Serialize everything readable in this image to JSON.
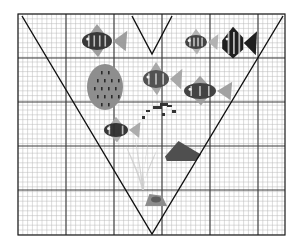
{
  "scene": {
    "title": "Aquarium scene on graph paper with V annotation",
    "canvas": {
      "width": 295,
      "height": 247,
      "background": "#ffffff"
    },
    "plot_area": {
      "x": 18,
      "y": 14,
      "width": 267,
      "height": 221
    },
    "border": {
      "color": "#1a1a1a",
      "width": 1.2
    }
  },
  "grid": {
    "minor": {
      "spacing": 4.8,
      "color": "#b9b9b9",
      "width": 0.5
    },
    "major": {
      "spacing": 48,
      "color": "#3a3a3a",
      "width": 1.1
    },
    "major_x": [
      66,
      114,
      162,
      210,
      258
    ],
    "major_y": [
      58,
      102,
      146,
      190
    ]
  },
  "annotations": {
    "big_v": {
      "name": "large-v-stroke",
      "color": "#111111",
      "width": 1.4,
      "points": "22,16 152,234 283,16"
    },
    "small_v": {
      "name": "small-v-stroke",
      "color": "#111111",
      "width": 1.4,
      "points": "132,16 152,54 172,16"
    }
  },
  "palette": {
    "ink_dark": "#2b2b2b",
    "ink_mid": "#6b6b6b",
    "ink_light": "#a8a8a8",
    "ink_pale": "#c9c9c9",
    "ink_faint": "#dedede"
  },
  "creatures": [
    {
      "id": "fish-striped-upper-left",
      "label": "Striped dark fish facing left",
      "type": "fish",
      "cx": 97,
      "cy": 41,
      "body_rx": 15,
      "body_ry": 9,
      "facing": "left",
      "body_color": "#2f2f2f",
      "fin_color": "#9a9a9a",
      "stripes": 4
    },
    {
      "id": "sponge-speckled-large",
      "label": "Large speckled gray sponge",
      "type": "sponge",
      "cx": 105,
      "cy": 87,
      "rx": 18,
      "ry": 23,
      "body_color": "#8e8e8e",
      "speck_color": "#2a2a2a",
      "speck_count": 18
    },
    {
      "id": "fish-diamond-center",
      "label": "Diamond-shaped fish center",
      "type": "fish",
      "cx": 156,
      "cy": 79,
      "body_rx": 13,
      "body_ry": 9,
      "facing": "left",
      "body_color": "#4a4a4a",
      "fin_color": "#a5a5a5",
      "stripes": 3
    },
    {
      "id": "fish-small-pale-upper-right",
      "label": "Small pale barred fish",
      "type": "fish",
      "cx": 196,
      "cy": 42,
      "body_rx": 11,
      "body_ry": 7,
      "facing": "left",
      "body_color": "#3b3b3b",
      "fin_color": "#b0b0b0",
      "stripes": 4
    },
    {
      "id": "fish-angel-upper-right",
      "label": "Dark angelfish upper right",
      "type": "angelfish",
      "cx": 233,
      "cy": 43,
      "body_rx": 12,
      "body_ry": 13,
      "facing": "left",
      "body_color": "#1f1f1f",
      "fin_color": "#8a8a8a",
      "stripes": 3
    },
    {
      "id": "fish-banded-right-mid",
      "label": "Banded fish right of center",
      "type": "fish",
      "cx": 200,
      "cy": 91,
      "body_rx": 16,
      "body_ry": 8,
      "facing": "left",
      "body_color": "#3a3a3a",
      "fin_color": "#9e9e9e",
      "stripes": 3
    },
    {
      "id": "fish-small-left-mid",
      "label": "Small dark fish left of center",
      "type": "fish",
      "cx": 116,
      "cy": 130,
      "body_rx": 12,
      "body_ry": 7,
      "facing": "left",
      "body_color": "#2d2d2d",
      "fin_color": "#a8a8a8",
      "stripes": 2
    },
    {
      "id": "fish-wedge-lower-right",
      "label": "Dark wedge fish lower right",
      "type": "wedge",
      "cx": 183,
      "cy": 151,
      "rx": 18,
      "ry": 10,
      "body_color": "#4f4f4f"
    },
    {
      "id": "snail-bottom",
      "label": "Small snail at bottom",
      "type": "snail",
      "cx": 156,
      "cy": 200,
      "rx": 11,
      "ry": 6,
      "body_color": "#8c8c8c"
    },
    {
      "id": "kelp-center",
      "label": "Pale kelp fronds",
      "type": "plant",
      "base_x": 142,
      "base_y": 190,
      "color": "#cccccc",
      "frond_count": 5
    },
    {
      "id": "debris-center",
      "label": "Scattered dark debris specks",
      "type": "debris",
      "cx": 158,
      "cy": 112,
      "color": "#333333",
      "count": 7
    }
  ]
}
